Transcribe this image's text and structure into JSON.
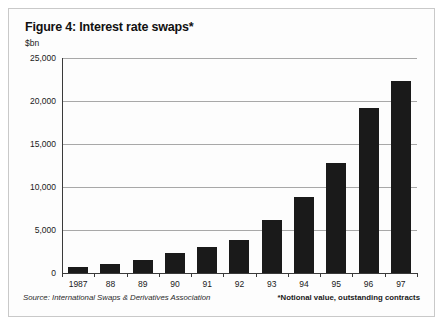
{
  "figure": {
    "title": "Figure 4: Interest rate swaps*",
    "unit_label": "$bn",
    "source": "Source: International Swaps & Derivatives Association",
    "note": "*Notional value, outstanding contracts"
  },
  "chart_data": {
    "type": "bar",
    "title": "Figure 4: Interest rate swaps*",
    "xlabel": "",
    "ylabel": "$bn",
    "ylim": [
      0,
      25000
    ],
    "yticks": [
      0,
      5000,
      10000,
      15000,
      20000,
      25000
    ],
    "ytick_labels": [
      "0",
      "5,000",
      "10,000",
      "15,000",
      "20,000",
      "25,000"
    ],
    "grid": true,
    "legend": null,
    "categories": [
      "1987",
      "88",
      "89",
      "90",
      "91",
      "92",
      "93",
      "94",
      "95",
      "96",
      "97"
    ],
    "values": [
      683,
      1010,
      1503,
      2312,
      3065,
      3851,
      6177,
      8816,
      12811,
      19171,
      22291
    ],
    "bar_color": "#1a1a1a",
    "annotations": [
      "*Notional value, outstanding contracts"
    ]
  }
}
